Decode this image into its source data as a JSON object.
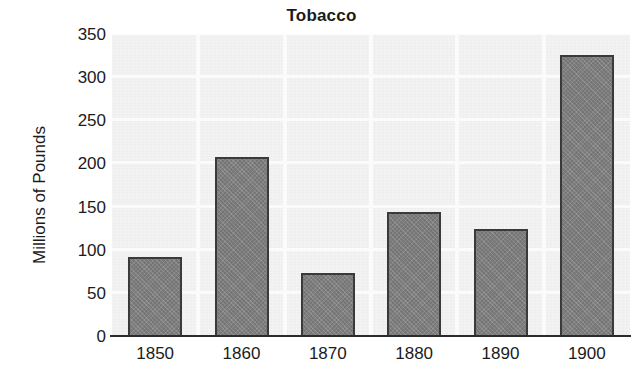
{
  "chart_data": {
    "type": "bar",
    "title": "Tobacco",
    "xlabel": "",
    "ylabel": "Millions of Pounds",
    "categories": [
      "1850",
      "1860",
      "1870",
      "1880",
      "1890",
      "1900"
    ],
    "values": [
      91,
      207,
      73,
      144,
      124,
      326
    ],
    "ylim": [
      0,
      350
    ],
    "ytick_labels": [
      "0",
      "50",
      "100",
      "150",
      "200",
      "250",
      "300",
      "350"
    ],
    "ytick_values": [
      0,
      50,
      100,
      150,
      200,
      250,
      300,
      350
    ],
    "grid": true,
    "legend": null,
    "series": [
      {
        "name": "Tobacco",
        "values": [
          91,
          207,
          73,
          144,
          124,
          326
        ]
      }
    ],
    "colors": {
      "bar_fill": "#808080",
      "bar_border": "#3a3a3a",
      "plot_background": "#efefef",
      "gridline": "#fbfbfb",
      "axis": "#2b2b2b",
      "text": "#1b1b1b",
      "figure_background": "#ffffff"
    }
  }
}
